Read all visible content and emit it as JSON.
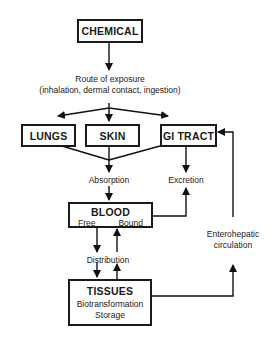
{
  "diagram": {
    "nodes": {
      "chemical": {
        "title": "CHEMICAL"
      },
      "lungs": {
        "title": "LUNGS"
      },
      "skin": {
        "title": "SKIN"
      },
      "gi_tract": {
        "title": "GI TRACT"
      },
      "blood": {
        "title": "BLOOD",
        "free": "Free",
        "bound": "Bound"
      },
      "tissues": {
        "title": "TISSUES",
        "line1": "Biotransformation",
        "line2": "Storage"
      }
    },
    "labels": {
      "route_line1": "Route of exposure",
      "route_line2": "(inhalation, dermal contact, ingestion)",
      "absorption": "Absorption",
      "excretion": "Excretion",
      "distribution": "Distribution",
      "enterohepatic_line1": "Enterohepatic",
      "enterohepatic_line2": "circulation"
    },
    "edges": [
      {
        "from": "CHEMICAL",
        "to": "Route of exposure"
      },
      {
        "from": "Route of exposure",
        "to": "LUNGS"
      },
      {
        "from": "Route of exposure",
        "to": "SKIN"
      },
      {
        "from": "Route of exposure",
        "to": "GI TRACT"
      },
      {
        "from": "LUNGS",
        "to": "Absorption"
      },
      {
        "from": "SKIN",
        "to": "Absorption"
      },
      {
        "from": "GI TRACT",
        "to": "Absorption"
      },
      {
        "from": "Absorption",
        "to": "BLOOD"
      },
      {
        "from": "GI TRACT",
        "to": "Excretion"
      },
      {
        "from": "BLOOD",
        "to": "Excretion"
      },
      {
        "from": "BLOOD",
        "to": "TISSUES",
        "label": "Distribution"
      },
      {
        "from": "TISSUES",
        "to": "BLOOD",
        "label": "Distribution"
      },
      {
        "from": "TISSUES",
        "to": "GI TRACT",
        "label": "Enterohepatic circulation"
      }
    ]
  }
}
